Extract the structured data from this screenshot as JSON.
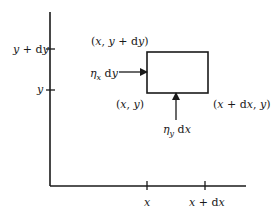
{
  "diagram": {
    "axes": {
      "y_ticks": [
        {
          "label_parts": [
            {
              "t": "y",
              "i": true
            },
            {
              "t": " + d",
              "i": false
            },
            {
              "t": "y",
              "i": true
            }
          ],
          "text": "y + dy"
        },
        {
          "label_parts": [
            {
              "t": "y",
              "i": true
            }
          ],
          "text": "y"
        }
      ],
      "x_ticks": [
        {
          "text": "x"
        },
        {
          "text": "x + dx"
        }
      ]
    },
    "corner_labels": {
      "top_left": "(x, y + dy)",
      "bottom_left": "(x, y)",
      "bottom_right": "(x + dx, y)"
    },
    "arrows": {
      "horizontal": "ηx dy",
      "vertical": "ηy dx"
    },
    "colors": {
      "line": "#1a1a1a",
      "background": "#ffffff"
    }
  }
}
